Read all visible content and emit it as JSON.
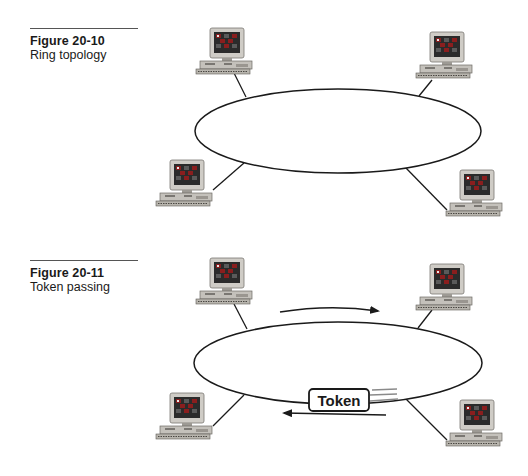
{
  "figures": [
    {
      "number": "Figure 20-10",
      "title": "Ring topology",
      "ring": {
        "cx": 338,
        "cy": 131,
        "rx": 143,
        "ry": 42
      },
      "nodes": [
        {
          "name": "top-left",
          "x": 196,
          "y": 28
        },
        {
          "name": "top-right",
          "x": 416,
          "y": 32
        },
        {
          "name": "bottom-left",
          "x": 156,
          "y": 160
        },
        {
          "name": "bottom-right",
          "x": 446,
          "y": 170
        }
      ]
    },
    {
      "number": "Figure 20-11",
      "title": "Token passing",
      "ring": {
        "cx": 338,
        "cy": 363,
        "rx": 144,
        "ry": 41
      },
      "nodes": [
        {
          "name": "top-left",
          "x": 196,
          "y": 258
        },
        {
          "name": "top-right",
          "x": 416,
          "y": 264
        },
        {
          "name": "bottom-left",
          "x": 156,
          "y": 393
        },
        {
          "name": "bottom-right",
          "x": 446,
          "y": 400
        }
      ],
      "token": {
        "label": "Token"
      },
      "arrows": [
        "clockwise-top",
        "counterclockwise-bottom"
      ]
    }
  ],
  "icons": {
    "node": "computer-workstation-icon",
    "flow_arrow": "arrow-icon",
    "motion_lines": "speed-lines-icon"
  },
  "colors": {
    "line": "#1a1a1a",
    "monitor_bezel": "#c9c6c0",
    "monitor_screen": "#2a2a2a",
    "screen_tile": "#8a1e1e",
    "base": "#bdbab3",
    "speed_lines": "#8a8a8a"
  }
}
